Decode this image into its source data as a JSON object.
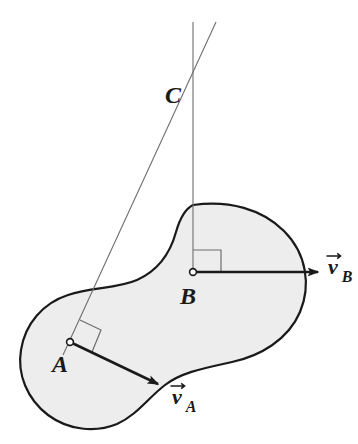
{
  "figure": {
    "kind": "rigid-body-instant-center-diagram",
    "background_color": "#ffffff",
    "body": {
      "name": "rigid-body-blob",
      "fill_color": "#ededed",
      "stroke_color": "#1a1a1a",
      "stroke_width": 2.2,
      "shape": "peanut",
      "outline_path": "M 193 205 C 229 200 262 209 284 231 C 307 254 311 286 300 312 C 288 340 260 356 232 362 C 205 368 182 372 165 385 C 148 398 137 415 117 424 C 95 433 68 430 48 415 C 27 399 17 374 21 350 C 25 324 43 303 68 295 C 92 287 116 289 137 280 C 157 271 170 254 176 232 C 180 218 185 209 193 205 Z"
    },
    "construction_lines": [
      {
        "name": "perpendicular-through-B",
        "orientation": "vertical",
        "x1": 193,
        "y1": 22,
        "x2": 193,
        "y2": 272,
        "stroke_color": "#6e6e6e",
        "stroke_width": 1.1
      },
      {
        "name": "perpendicular-through-A",
        "orientation": "slanted",
        "x1": 216,
        "y1": 22,
        "x2": 63,
        "y2": 355,
        "stroke_color": "#6e6e6e",
        "stroke_width": 1.1
      }
    ],
    "points": [
      {
        "id": "A",
        "label": "A",
        "name": "point-a",
        "cx": 70,
        "cy": 342,
        "marker": "open-circle",
        "marker_radius": 3.4,
        "label_x": 52,
        "label_y": 372,
        "label_font_size": 24
      },
      {
        "id": "B",
        "label": "B",
        "name": "point-b",
        "cx": 193,
        "cy": 272,
        "marker": "open-circle",
        "marker_radius": 3.4,
        "label_x": 180,
        "label_y": 304,
        "label_font_size": 24
      },
      {
        "id": "C",
        "label": "C",
        "name": "point-c-instant-center",
        "cx": 193,
        "cy": 95,
        "marker": "none",
        "marker_radius": 0,
        "label_x": 165,
        "label_y": 103,
        "label_font_size": 24
      }
    ],
    "vectors": [
      {
        "id": "vB",
        "name": "velocity-vector-b",
        "base_letter": "v",
        "subscript": "B",
        "x1": 193,
        "y1": 272,
        "x2": 318,
        "y2": 272,
        "stroke_color": "#1a1a1a",
        "stroke_width": 2.6,
        "arrowhead": "solid-triangle",
        "label_x": 328,
        "label_y": 274,
        "label_font_size": 22,
        "sub_font_size": 16
      },
      {
        "id": "vA",
        "name": "velocity-vector-a",
        "base_letter": "v",
        "subscript": "A",
        "x1": 70,
        "y1": 342,
        "x2": 158,
        "y2": 384,
        "stroke_color": "#1a1a1a",
        "stroke_width": 2.6,
        "arrowhead": "solid-triangle",
        "label_x": 172,
        "label_y": 404,
        "label_font_size": 22,
        "sub_font_size": 16
      }
    ],
    "right_angle_markers": [
      {
        "name": "right-angle-marker-b",
        "at_point": "B",
        "path": "M 193 250 L 221 250 L 221 272",
        "stroke_color": "#6e6e6e",
        "stroke_width": 1.2
      },
      {
        "name": "right-angle-marker-a",
        "at_point": "A",
        "path": "M 80 320 L 101 330 L 92 352",
        "stroke_color": "#6e6e6e",
        "stroke_width": 1.2
      }
    ]
  }
}
